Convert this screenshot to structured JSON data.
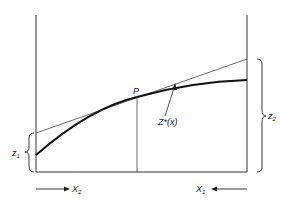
{
  "labels": {
    "point": "P",
    "curve": "Z*(x)",
    "z1": "z",
    "z1_sub": "1",
    "z2": "z",
    "z2_sub": "2",
    "x2": "X",
    "x2_sub": "2",
    "x1": "X",
    "x1_sub": "1"
  }
}
